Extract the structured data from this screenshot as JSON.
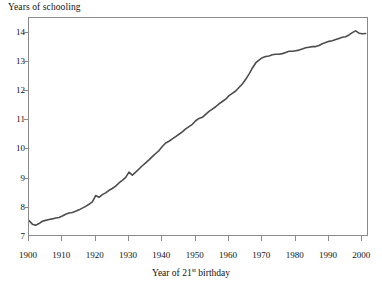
{
  "chart_data": {
    "type": "line",
    "title": "",
    "xlabel": "Year of 21st birthday",
    "xlabel_base": "Year of 21",
    "xlabel_sup": "st",
    "xlabel_tail": " birthday",
    "ylabel": "Years of schooling",
    "xlim": [
      1900,
      2002
    ],
    "ylim": [
      7,
      14.5
    ],
    "grid": false,
    "legend": null,
    "line_color": "#4d4d4d",
    "axis_color": "#8a8a8a",
    "xticks": [
      1900,
      1910,
      1920,
      1930,
      1940,
      1950,
      1960,
      1970,
      1980,
      1990,
      2000
    ],
    "xtick_labels": [
      "1900",
      "1910",
      "1920",
      "1930",
      "1940",
      "1950",
      "1960",
      "1970",
      "1980",
      "1990",
      "2000"
    ],
    "yticks": [
      7,
      8,
      9,
      10,
      11,
      12,
      13,
      14
    ],
    "ytick_labels": [
      "7",
      "8",
      "9",
      "10",
      "11",
      "12",
      "13",
      "14"
    ],
    "series": [
      {
        "name": "Years of schooling",
        "x": [
          1900,
          1901,
          1902,
          1903,
          1904,
          1905,
          1906,
          1907,
          1908,
          1909,
          1910,
          1911,
          1912,
          1913,
          1914,
          1915,
          1916,
          1917,
          1918,
          1919,
          1920,
          1921,
          1922,
          1923,
          1924,
          1925,
          1926,
          1927,
          1928,
          1929,
          1930,
          1931,
          1932,
          1933,
          1934,
          1935,
          1936,
          1937,
          1938,
          1939,
          1940,
          1941,
          1942,
          1943,
          1944,
          1945,
          1946,
          1947,
          1948,
          1949,
          1950,
          1951,
          1952,
          1953,
          1954,
          1955,
          1956,
          1957,
          1958,
          1959,
          1960,
          1961,
          1962,
          1963,
          1964,
          1965,
          1966,
          1967,
          1968,
          1969,
          1970,
          1971,
          1972,
          1973,
          1974,
          1975,
          1976,
          1977,
          1978,
          1979,
          1980,
          1981,
          1982,
          1983,
          1984,
          1985,
          1986,
          1987,
          1988,
          1989,
          1990,
          1991,
          1992,
          1993,
          1994,
          1995,
          1996,
          1997,
          1998,
          1999,
          2000,
          2001
        ],
        "values": [
          7.56,
          7.44,
          7.4,
          7.46,
          7.54,
          7.57,
          7.6,
          7.62,
          7.65,
          7.67,
          7.72,
          7.78,
          7.82,
          7.84,
          7.88,
          7.93,
          7.99,
          8.05,
          8.12,
          8.2,
          8.42,
          8.36,
          8.45,
          8.51,
          8.6,
          8.66,
          8.74,
          8.85,
          8.94,
          9.04,
          9.22,
          9.12,
          9.22,
          9.33,
          9.44,
          9.54,
          9.64,
          9.75,
          9.86,
          9.96,
          10.1,
          10.22,
          10.28,
          10.36,
          10.44,
          10.52,
          10.6,
          10.7,
          10.78,
          10.86,
          10.98,
          11.06,
          11.1,
          11.2,
          11.3,
          11.38,
          11.46,
          11.56,
          11.64,
          11.72,
          11.84,
          11.92,
          12.0,
          12.12,
          12.24,
          12.4,
          12.58,
          12.78,
          12.96,
          13.06,
          13.14,
          13.18,
          13.2,
          13.24,
          13.26,
          13.26,
          13.28,
          13.32,
          13.36,
          13.36,
          13.38,
          13.4,
          13.44,
          13.48,
          13.5,
          13.52,
          13.52,
          13.56,
          13.62,
          13.66,
          13.7,
          13.72,
          13.76,
          13.8,
          13.84,
          13.86,
          13.92,
          14.0,
          14.06,
          13.98,
          13.96,
          13.97
        ]
      }
    ]
  }
}
